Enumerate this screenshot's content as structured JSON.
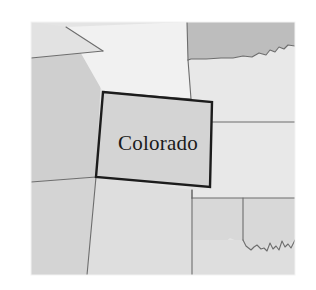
{
  "figure": {
    "kind": "locator-map",
    "subject": "Colorado",
    "background_color": "#ffffff",
    "frame": {
      "x": 31,
      "y": 22,
      "width": 264,
      "height": 253
    }
  },
  "palette": {
    "highlight_fill": "#d4d4d4",
    "highlight_stroke": "#1c1c1c",
    "lightest_fill": "#f1f1f1",
    "light_fill": "#e8e8e8",
    "mid_light_fill": "#e2e2e2",
    "mid_fill": "#d8d8d8",
    "medium_fill": "#cfcfcf",
    "dark_fill": "#bdbdbd",
    "border_stroke": "#6d6d6d",
    "label_color": "#1a1a1a"
  },
  "labels": {
    "colorado": {
      "text": "Colorado",
      "x": 158,
      "y": 145
    }
  },
  "regions": [
    {
      "name": "utah",
      "role": "neighbor",
      "fill": "#cfcfcf",
      "points": "31,58 103,51 100,96 96,177 31,182"
    },
    {
      "name": "wyoming",
      "role": "neighbor",
      "fill": "#f1f1f1",
      "points": "66,27 187,22 188,60 191,99 103,92"
    },
    {
      "name": "idaho-corner",
      "role": "neighbor",
      "fill": "#e2e2e2",
      "points": "31,22 66,27 103,51 31,58"
    },
    {
      "name": "south-dakota",
      "role": "neighbor",
      "fill": "#bdbdbd",
      "points": "187,22 295,22 295,46 288,45 284,49 279,47 275,52 270,50 266,55 259,53 252,57 243,56 233,58 221,58 206,59 191,59 188,60"
    },
    {
      "name": "nebraska",
      "role": "neighbor",
      "fill": "#e8e8e8",
      "points": "188,60 191,59 206,59 221,58 233,58 243,56 252,57 259,53 266,55 270,50 275,52 279,47 284,49 288,45 295,46 295,122 212,122 212,102 191,99"
    },
    {
      "name": "kansas",
      "role": "neighbor",
      "fill": "#e8e8e8",
      "points": "212,122 295,122 295,198 192,198 192,190 210,187"
    },
    {
      "name": "oklahoma",
      "role": "neighbor",
      "fill": "#d8d8d8",
      "points": "192,198 295,198 295,240 288,244 282,241 276,246 270,243 264,248 257,245 251,250 246,246 243,240 243,240 243,240 243,240 243,240 243,198"
    },
    {
      "name": "oklahoma-panhandle-body",
      "role": "neighbor",
      "fill": "#d8d8d8",
      "points": "192,198 243,198 243,240 237,241 230,238 224,243 218,240 212,245 205,242 199,247 193,244"
    },
    {
      "name": "new-mexico",
      "role": "neighbor",
      "fill": "#dedede",
      "points": "96,177 192,190 192,198 192,275 87,275"
    },
    {
      "name": "arizona",
      "role": "neighbor",
      "fill": "#d4d4d4",
      "points": "31,182 96,177 87,275 31,275"
    },
    {
      "name": "texas-panhandle",
      "role": "neighbor",
      "fill": "#dedede",
      "points": "192,240 243,240 246,246 251,250 257,245 264,248 270,243 276,246 282,241 288,244 295,240 295,275 192,275"
    },
    {
      "name": "colorado",
      "role": "highlight",
      "fill": "#d4d4d4",
      "points": "103,92 212,102 210,187 96,177"
    }
  ],
  "borders": [
    {
      "name": "utah-wyoming-edge",
      "path": "M31,58 L103,51"
    },
    {
      "name": "idaho-wyoming-edge",
      "path": "M66,27 L103,51"
    },
    {
      "name": "wyoming-south-edge",
      "path": "M103,92 L191,99"
    },
    {
      "name": "wyoming-nebraska-edge",
      "path": "M188,60 L191,99"
    },
    {
      "name": "wyoming-southdakota-edge",
      "path": "M187,22 L188,60"
    },
    {
      "name": "southdakota-nebraska-edge",
      "path": "M188,60 L191,59 L206,59 L221,58 L233,58 L243,56 L252,57 L259,53 L266,55 L270,50 L275,52 L279,47 L284,49 L288,45 L295,46"
    },
    {
      "name": "nebraska-kansas-edge",
      "path": "M212,122 L295,122"
    },
    {
      "name": "utah-arizona-edge",
      "path": "M31,182 L96,177"
    },
    {
      "name": "arizona-newmexico-edge",
      "path": "M96,177 L87,275"
    },
    {
      "name": "kansas-oklahoma-edge",
      "path": "M192,198 L295,198"
    },
    {
      "name": "oklahoma-panhandle-west-edge",
      "path": "M192,190 L192,198"
    },
    {
      "name": "oklahoma-panhandle-east-edge",
      "path": "M243,198 L243,240"
    },
    {
      "name": "colorado-newmexico-extension",
      "path": "M192,190 L192,198"
    },
    {
      "name": "red-river-border",
      "path": "M243,240 L246,246 L251,250 L254,247 L257,245 L261,249 L264,248 L267,251 L270,243 L273,249 L276,246 L279,250 L282,241 L285,247 L288,244 L291,248 L295,240"
    },
    {
      "name": "newmexico-oklahoma-edge",
      "path": "M192,198 L192,275"
    }
  ],
  "highlight_outline": {
    "name": "colorado-outline",
    "path": "M103,92 L212,102 L210,187 L96,177 Z",
    "stroke_width": 2.4
  }
}
